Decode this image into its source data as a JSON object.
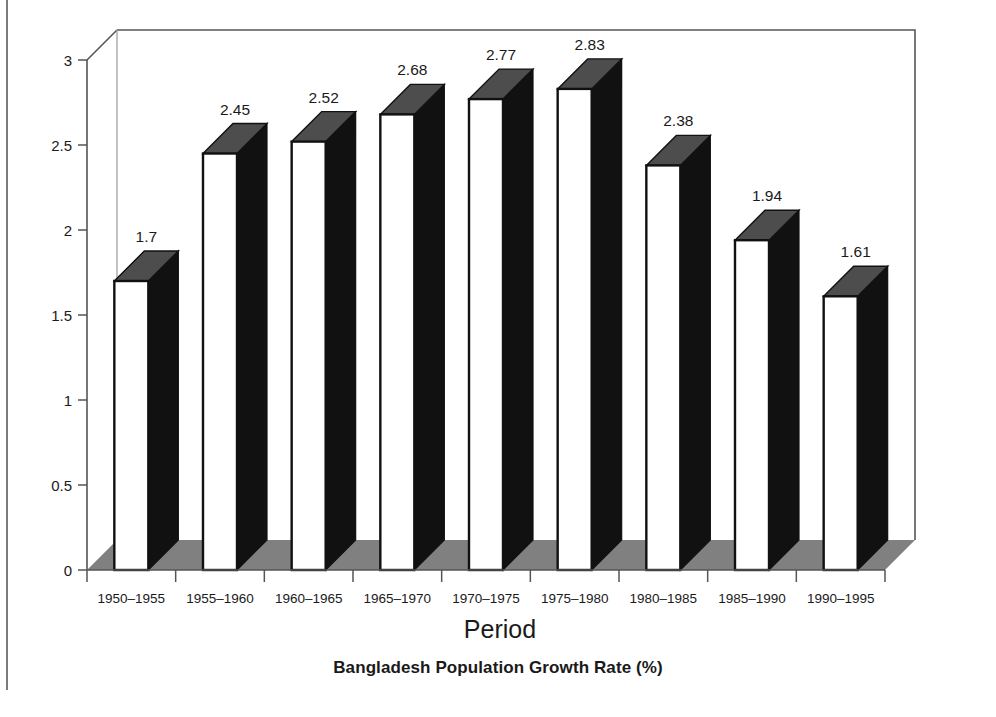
{
  "figure": {
    "caption": "Bangladesh Population Growth Rate (%)"
  },
  "chart_data": {
    "type": "bar",
    "title": "",
    "subtitle": "",
    "xlabel": "Period",
    "ylabel": "",
    "categories": [
      "1950–1955",
      "1955–1960",
      "1960–1965",
      "1965–1970",
      "1970–1975",
      "1975–1980",
      "1980–1985",
      "1985–1990",
      "1990–1995"
    ],
    "values": [
      1.7,
      2.45,
      2.52,
      2.68,
      2.77,
      2.83,
      2.38,
      1.94,
      1.61
    ],
    "value_labels": [
      "1.7",
      "2.45",
      "2.52",
      "2.68",
      "2.77",
      "2.83",
      "2.38",
      "1.94",
      "1.61"
    ],
    "ylim": [
      0,
      3
    ],
    "ytick_values": [
      0,
      0.5,
      1,
      1.5,
      2,
      2.5,
      3
    ],
    "ytick_labels": [
      "0",
      "0.5",
      "1",
      "1.5",
      "2",
      "2.5",
      "3"
    ],
    "grid": false,
    "legend": null,
    "style": "3d-column",
    "colors": {
      "bar_front": "#ffffff",
      "bar_side": "#111111",
      "bar_top": "#4d4d4d",
      "bar_outline": "#111111",
      "floor": "#808080",
      "axis_line": "#555555",
      "text": "#1a1a1a"
    }
  }
}
